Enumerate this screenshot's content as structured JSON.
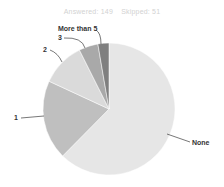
{
  "header": {
    "answered": "Answered: 149",
    "skipped": "Skipped: 51"
  },
  "chart_data": {
    "type": "pie",
    "title": "",
    "subtitle": "Answered: 149   Skipped: 51",
    "categories": [
      "None",
      "1",
      "2",
      "3",
      "More than 5"
    ],
    "values": [
      62.4,
      19.5,
      10.7,
      4.7,
      2.7
    ],
    "colors": [
      "#e6e6e6",
      "#bfbfbf",
      "#dadada",
      "#a9a9a9",
      "#7f7f7f"
    ],
    "start_angle": "12 o'clock, clockwise",
    "legend": "none (callout labels)"
  },
  "labels": {
    "none": "None",
    "one": "1",
    "two": "2",
    "three": "3",
    "more_than_5": "More than 5"
  }
}
